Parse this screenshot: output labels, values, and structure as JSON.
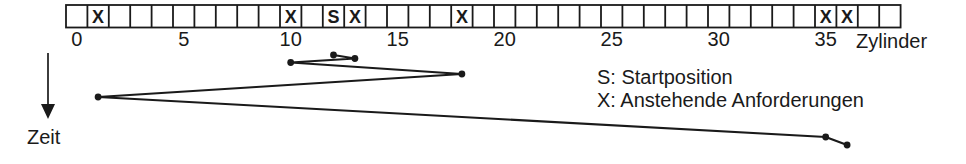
{
  "strip": {
    "cylinder_count": 39,
    "start_symbol": "S",
    "request_symbol": "X",
    "start_position": 12,
    "request_positions": [
      1,
      10,
      13,
      18,
      35,
      36
    ]
  },
  "axis": {
    "ticks": [
      0,
      5,
      10,
      15,
      20,
      25,
      30,
      35
    ],
    "label": "Zylinder"
  },
  "time_axis": {
    "label": "Zeit"
  },
  "legend": {
    "start_line": "S: Startposition",
    "requests_line": "X: Anstehende Anforderungen"
  },
  "head_path": {
    "cylinder_sequence": [
      12,
      13,
      10,
      18,
      1,
      35,
      36
    ]
  },
  "colors": {
    "ink": "#1a1a1a",
    "background": "#ffffff"
  }
}
